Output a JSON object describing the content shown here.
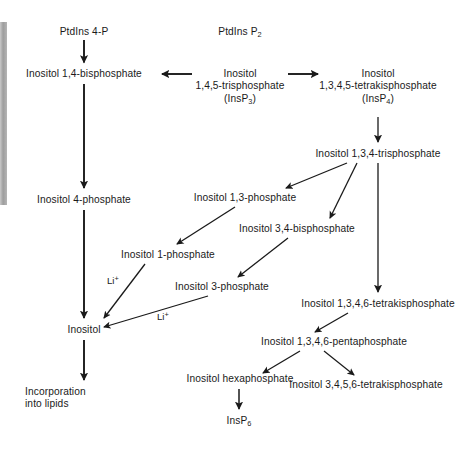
{
  "figure": {
    "ink_color": "#1a1a1a",
    "background_color": "#ffffff",
    "edge_bar_color": "#9d9d9d"
  },
  "nodes": {
    "ptdins_4p": "PtdIns 4-P",
    "ptdins_p2_main": "PtdIns P",
    "ptdins_p2_sub": "2",
    "ins_14_bisphosphate": "Inositol 1,4-bisphosphate",
    "insp3_line1": "Inositol",
    "insp3_line2": "1,4,5-trisphosphate",
    "insp3_line3_open": "(InsP",
    "insp3_line3_sub": "3",
    "insp3_line3_close": ")",
    "insp4_line1": "Inositol",
    "insp4_line2": "1,3,4,5-tetrakisphosphate",
    "insp4_line3_open": "(InsP",
    "insp4_line3_sub": "4",
    "insp4_line3_close": ")",
    "ins_134_trisphosphate": "Inositol 1,3,4-trisphosphate",
    "ins_4_phosphate": "Inositol 4-phosphate",
    "ins_13_phosphate": "Inositol 1,3-phosphate",
    "ins_34_bisphosphate": "Inositol 3,4-bisphosphate",
    "ins_1_phosphate": "Inositol 1-phosphate",
    "ins_3_phosphate": "Inositol 3-phosphate",
    "ins_1346_tetrakisphosphate": "Inositol 1,3,4,6-tetrakisphosphate",
    "inositol": "Inositol",
    "ins_1346_pentaphosphate": "Inositol 1,3,4,6-pentaphosphate",
    "ins_hexaphosphate": "Inositol hexaphosphate",
    "ins_3456_tetrakisphosphate": "Inositol 3,4,5,6-tetrakisphosphate",
    "insp6_main": "InsP",
    "insp6_sub": "6",
    "incorporation_line1": "Incorporation",
    "incorporation_line2": "into lipids"
  },
  "inhibitors": {
    "li_upper_main": "Li",
    "li_upper_sup": "+",
    "li_lower_main": "Li",
    "li_lower_sup": "+"
  },
  "edges": [
    {
      "from": "ptdins_4p",
      "to": "ins_14_bisphosphate",
      "style": "thick-vertical"
    },
    {
      "from": "insp3",
      "to": "ins_14_bisphosphate",
      "style": "thick-horizontal-left"
    },
    {
      "from": "insp3",
      "to": "insp4",
      "style": "thick-horizontal-right"
    },
    {
      "from": "insp4",
      "to": "ins_134_trisphosphate",
      "style": "thin-vertical"
    },
    {
      "from": "ins_14_bisphosphate",
      "to": "ins_4_phosphate",
      "style": "thick-vertical"
    },
    {
      "from": "ins_4_phosphate",
      "to": "inositol",
      "style": "thick-vertical"
    },
    {
      "from": "ins_134_trisphosphate",
      "to": "ins_13_phosphate",
      "style": "thin-diagonal"
    },
    {
      "from": "ins_134_trisphosphate",
      "to": "ins_34_bisphosphate",
      "style": "thin-diagonal"
    },
    {
      "from": "ins_134_trisphosphate",
      "to": "ins_1346_tetrakisphosphate",
      "style": "thin-vertical"
    },
    {
      "from": "ins_13_phosphate",
      "to": "ins_1_phosphate",
      "style": "thin-diagonal"
    },
    {
      "from": "ins_34_bisphosphate",
      "to": "ins_3_phosphate",
      "style": "thin-diagonal"
    },
    {
      "from": "ins_1_phosphate",
      "to": "inositol",
      "style": "thin-diagonal",
      "label": "li_upper"
    },
    {
      "from": "ins_3_phosphate",
      "to": "inositol",
      "style": "thin-diagonal",
      "label": "li_lower"
    },
    {
      "from": "inositol",
      "to": "incorporation",
      "style": "thick-vertical"
    },
    {
      "from": "ins_1346_tetrakisphosphate",
      "to": "ins_1346_pentaphosphate",
      "style": "thin-diagonal"
    },
    {
      "from": "ins_1346_pentaphosphate",
      "to": "ins_hexaphosphate",
      "style": "thin-diagonal"
    },
    {
      "from": "ins_1346_pentaphosphate",
      "to": "ins_3456_tetrakisphosphate",
      "style": "thin-diagonal"
    },
    {
      "from": "ins_hexaphosphate",
      "to": "insp6",
      "style": "thick-vertical"
    }
  ]
}
